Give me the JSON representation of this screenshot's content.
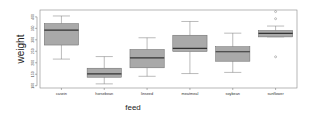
{
  "chart_data": {
    "type": "boxplot",
    "title": "",
    "xlabel": "feed",
    "ylabel": "weight",
    "ylim": [
      90,
      430
    ],
    "yticks": [
      100,
      150,
      200,
      250,
      300,
      350,
      400
    ],
    "grid": false,
    "box_color": "#a9a9a9",
    "categories": [
      "casein",
      "horsebean",
      "linseed",
      "meatmeal",
      "soybean",
      "sunflower"
    ],
    "boxes": [
      {
        "name": "casein",
        "min": 216,
        "q1": 277.25,
        "median": 342,
        "q3": 370.75,
        "max": 404,
        "outliers": []
      },
      {
        "name": "horsebean",
        "min": 108,
        "q1": 137,
        "median": 151.5,
        "q3": 176.25,
        "max": 227,
        "outliers": []
      },
      {
        "name": "linseed",
        "min": 141,
        "q1": 178,
        "median": 221,
        "q3": 257.75,
        "max": 309,
        "outliers": []
      },
      {
        "name": "meatmeal",
        "min": 153,
        "q1": 249.25,
        "median": 263,
        "q3": 320,
        "max": 380,
        "outliers": []
      },
      {
        "name": "soybean",
        "min": 158,
        "q1": 206.75,
        "median": 248,
        "q3": 270,
        "max": 329,
        "outliers": []
      },
      {
        "name": "sunflower",
        "min": 318,
        "q1": 312.75,
        "median": 328,
        "q3": 340.75,
        "max": 360,
        "outliers": [
          423,
          392,
          226
        ]
      }
    ]
  }
}
